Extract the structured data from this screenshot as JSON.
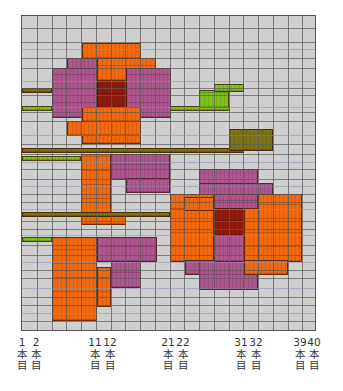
{
  "colors": {
    "background": "#cfcfcf",
    "orange": "#f26a0f",
    "purple": "#b0568f",
    "dark_red": "#8e1a0c",
    "olive": "#7b7414",
    "green": "#7fc21e"
  },
  "chart_data": {
    "type": "heatmap",
    "title": "",
    "columns": 20,
    "strands": 40,
    "grid_px": {
      "left": 21,
      "top": 15,
      "width": 295,
      "height": 316,
      "col_width": 14.75
    },
    "x_tick_labels": [
      {
        "strand": "1",
        "label": [
          "1",
          "本",
          "目"
        ],
        "x": 22
      },
      {
        "strand": "2",
        "label": [
          "2",
          "本",
          "目"
        ],
        "x": 36
      },
      {
        "strand": "11",
        "label": [
          "11",
          "本",
          "目"
        ],
        "x": 95
      },
      {
        "strand": "12",
        "label": [
          "12",
          "本",
          "目"
        ],
        "x": 110
      },
      {
        "strand": "21",
        "label": [
          "21",
          "本",
          "目"
        ],
        "x": 168
      },
      {
        "strand": "22",
        "label": [
          "22",
          "本",
          "目"
        ],
        "x": 183
      },
      {
        "strand": "31",
        "label": [
          "31",
          "本",
          "目"
        ],
        "x": 241
      },
      {
        "strand": "32",
        "label": [
          "32",
          "本",
          "目"
        ],
        "x": 256
      },
      {
        "strand": "39",
        "label": [
          "39",
          "本",
          "目"
        ],
        "x": 300
      },
      {
        "strand": "40",
        "label": [
          "40",
          "本",
          "目"
        ],
        "x": 314
      }
    ],
    "legend": [
      {
        "name": "orange",
        "color": "#f26a0f"
      },
      {
        "name": "purple",
        "color": "#b0568f"
      },
      {
        "name": "dark_red",
        "color": "#8e1a0c"
      },
      {
        "name": "olive",
        "color": "#7b7414"
      },
      {
        "name": "green",
        "color": "#7fc21e"
      }
    ],
    "blocks": [
      {
        "c": "orange",
        "x": 60,
        "y": 27,
        "w": 59,
        "h": 16
      },
      {
        "c": "orange",
        "x": 75,
        "y": 42,
        "w": 59,
        "h": 23
      },
      {
        "c": "purple",
        "x": 45,
        "y": 42,
        "w": 30,
        "h": 12
      },
      {
        "c": "purple",
        "x": 30,
        "y": 52,
        "w": 45,
        "h": 50
      },
      {
        "c": "purple",
        "x": 104,
        "y": 52,
        "w": 45,
        "h": 50
      },
      {
        "c": "dark_red",
        "x": 75,
        "y": 65,
        "w": 30,
        "h": 28
      },
      {
        "c": "orange",
        "x": 60,
        "y": 91,
        "w": 59,
        "h": 15
      },
      {
        "c": "orange",
        "x": 45,
        "y": 105,
        "w": 74,
        "h": 15
      },
      {
        "c": "orange",
        "x": 60,
        "y": 119,
        "w": 59,
        "h": 9
      },
      {
        "c": "olive",
        "x": 0,
        "y": 72,
        "w": 30,
        "h": 5
      },
      {
        "c": "green",
        "x": 0,
        "y": 90,
        "w": 30,
        "h": 5
      },
      {
        "c": "green",
        "x": 148,
        "y": 90,
        "w": 60,
        "h": 5
      },
      {
        "c": "green",
        "x": 177,
        "y": 74,
        "w": 30,
        "h": 18
      },
      {
        "c": "green",
        "x": 192,
        "y": 68,
        "w": 30,
        "h": 8
      },
      {
        "c": "olive",
        "x": 0,
        "y": 132,
        "w": 222,
        "h": 5
      },
      {
        "c": "olive",
        "x": 207,
        "y": 113,
        "w": 44,
        "h": 22
      },
      {
        "c": "green",
        "x": 0,
        "y": 140,
        "w": 59,
        "h": 5
      },
      {
        "c": "orange",
        "x": 59,
        "y": 138,
        "w": 30,
        "h": 60
      },
      {
        "c": "orange",
        "x": 59,
        "y": 197,
        "w": 45,
        "h": 12
      },
      {
        "c": "purple",
        "x": 89,
        "y": 138,
        "w": 59,
        "h": 26
      },
      {
        "c": "purple",
        "x": 104,
        "y": 162,
        "w": 44,
        "h": 15
      },
      {
        "c": "olive",
        "x": 0,
        "y": 196,
        "w": 148,
        "h": 5
      },
      {
        "c": "green",
        "x": 0,
        "y": 221,
        "w": 30,
        "h": 5
      },
      {
        "c": "orange",
        "x": 30,
        "y": 221,
        "w": 45,
        "h": 84
      },
      {
        "c": "orange",
        "x": 75,
        "y": 251,
        "w": 14,
        "h": 40
      },
      {
        "c": "purple",
        "x": 75,
        "y": 221,
        "w": 60,
        "h": 25
      },
      {
        "c": "purple",
        "x": 89,
        "y": 245,
        "w": 30,
        "h": 27
      },
      {
        "c": "purple",
        "x": 177,
        "y": 153,
        "w": 59,
        "h": 16
      },
      {
        "c": "purple",
        "x": 177,
        "y": 167,
        "w": 74,
        "h": 14
      },
      {
        "c": "orange",
        "x": 148,
        "y": 178,
        "w": 44,
        "h": 16
      },
      {
        "c": "orange",
        "x": 148,
        "y": 193,
        "w": 44,
        "h": 53
      },
      {
        "c": "orange",
        "x": 162,
        "y": 181,
        "w": 30,
        "h": 14
      },
      {
        "c": "purple",
        "x": 192,
        "y": 178,
        "w": 44,
        "h": 22
      },
      {
        "c": "dark_red",
        "x": 192,
        "y": 192,
        "w": 30,
        "h": 28
      },
      {
        "c": "orange",
        "x": 236,
        "y": 178,
        "w": 44,
        "h": 68
      },
      {
        "c": "orange",
        "x": 222,
        "y": 192,
        "w": 15,
        "h": 54
      },
      {
        "c": "purple",
        "x": 163,
        "y": 244,
        "w": 29,
        "h": 15
      },
      {
        "c": "purple",
        "x": 177,
        "y": 244,
        "w": 59,
        "h": 30
      },
      {
        "c": "purple",
        "x": 192,
        "y": 219,
        "w": 30,
        "h": 27
      },
      {
        "c": "orange",
        "x": 222,
        "y": 244,
        "w": 44,
        "h": 15
      }
    ]
  }
}
